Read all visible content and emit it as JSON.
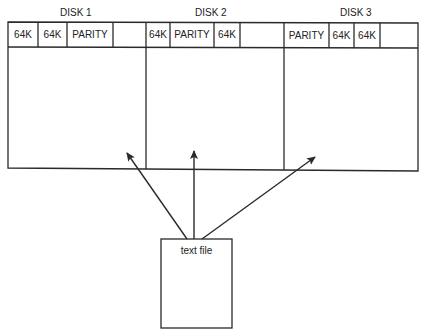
{
  "diagram": {
    "disks": [
      {
        "label": "DISK 1",
        "blocks": [
          "64K",
          "64K",
          "PARITY",
          ""
        ]
      },
      {
        "label": "DISK 2",
        "blocks": [
          "64K",
          "PARITY",
          "64K",
          ""
        ]
      },
      {
        "label": "DISK 3",
        "blocks": [
          "PARITY",
          "64K",
          "64K",
          ""
        ]
      }
    ],
    "source": {
      "label": "text file"
    },
    "arrows": [
      {
        "from": "text file",
        "to": "DISK 1"
      },
      {
        "from": "text file",
        "to": "DISK 2"
      },
      {
        "from": "text file",
        "to": "DISK 3"
      }
    ],
    "colors": {
      "line": "#2a2a2a",
      "background": "#ffffff",
      "text": "#222222"
    }
  }
}
